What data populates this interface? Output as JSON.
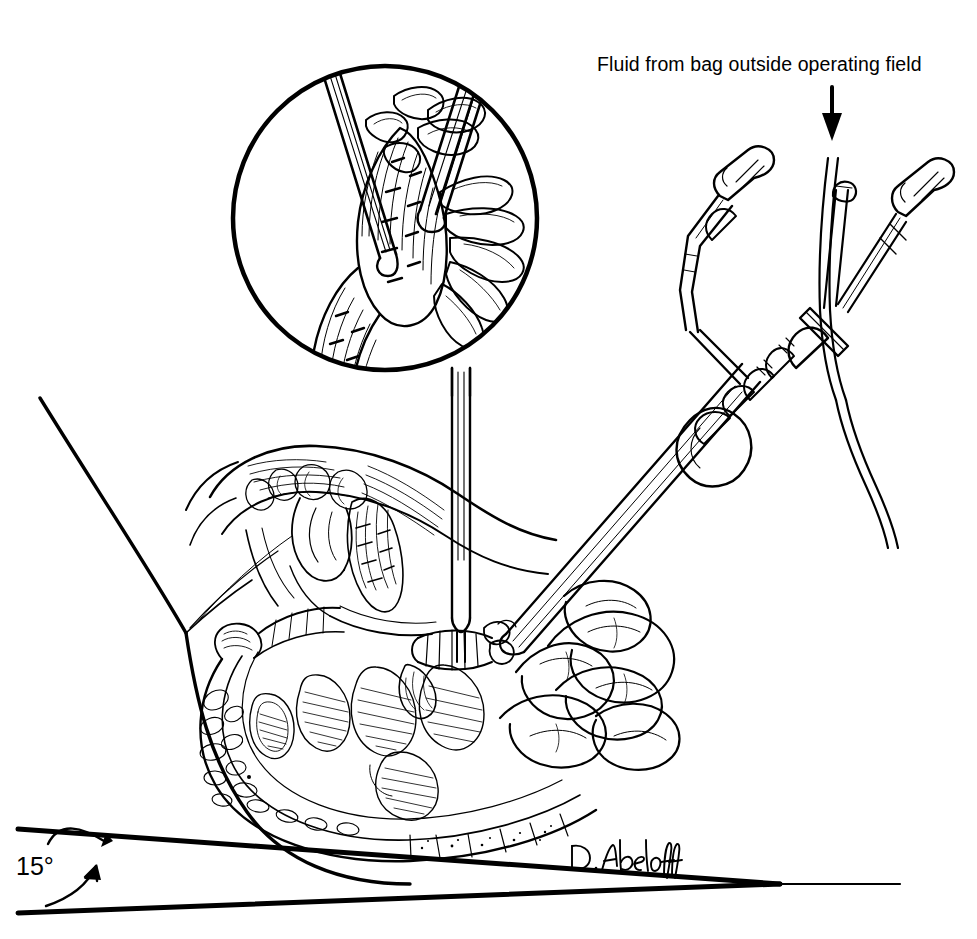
{
  "figure": {
    "background_color": "#ffffff",
    "ink_color": "#000000",
    "width": 977,
    "height": 939
  },
  "annotations": {
    "fluid_caption": "Fluid from bag outside operating field",
    "angle_label": "15°",
    "artist_signature": "D. Abeloff"
  },
  "icons": {
    "down_arrow": "down-arrow-icon",
    "angle_arc": "angle-arc-icon",
    "inset_circle": "magnified-inset-circle"
  },
  "diagram_parts": [
    {
      "name": "magnified-inset",
      "label": "Magnified view of appendiceal base with grasper and clip"
    },
    {
      "name": "irrigator-handle",
      "label": "Laparoscopic irrigator-aspirator handle"
    },
    {
      "name": "irrigation-tubing",
      "label": "Irrigation tubing from fluid bag"
    },
    {
      "name": "trocar-cannula",
      "label": "Trocar cannula through abdominal wall"
    },
    {
      "name": "grasper-instrument",
      "label": "Grasping forceps on appendix"
    },
    {
      "name": "abdominal-wall",
      "label": "Abdominal wall cross-section"
    },
    {
      "name": "cecum-colon",
      "label": "Cecum and ascending colon"
    },
    {
      "name": "small-bowel",
      "label": "Small bowel loops"
    },
    {
      "name": "appendix",
      "label": "Appendix"
    },
    {
      "name": "operating-table-angle",
      "label": "Operating table tilted 15 degrees"
    }
  ]
}
